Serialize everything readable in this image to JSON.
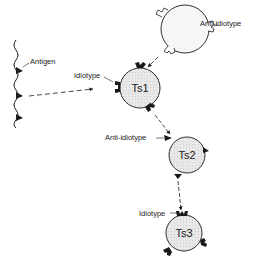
{
  "diagram": {
    "type": "idiotype network cascade",
    "nodes": [
      {
        "id": "antigen",
        "label": "Antigen",
        "shape": "wavy chain with triangular determinants"
      },
      {
        "id": "anti_idiotype_cell",
        "label": "",
        "annotation": "Anti-idiotype",
        "shape": "circle, light stipple, hollow receptors"
      },
      {
        "id": "ts1",
        "label": "Ts1",
        "annotation": "Idiotype",
        "shape": "circle, stippled, black receptors"
      },
      {
        "id": "ts2",
        "label": "Ts2",
        "annotation": "Anti-idiotype",
        "shape": "circle, stippled, black triangles"
      },
      {
        "id": "ts3",
        "label": "Ts3",
        "annotation": "Idiotype",
        "shape": "circle, stippled, black receptors"
      }
    ],
    "edges": [
      {
        "from": "antigen",
        "to": "ts1",
        "style": "dashed arrow"
      },
      {
        "from": "anti_idiotype_cell",
        "to": "ts1",
        "style": "dashed arrow"
      },
      {
        "from": "ts1",
        "to": "ts2",
        "style": "dashed arrow"
      },
      {
        "from": "ts2",
        "to": "ts3",
        "style": "dashed arrow"
      }
    ]
  },
  "labels": {
    "antigen": "Antigen",
    "anti_idiotype_top": "Anti-idiotype",
    "idiotype_ts1": "Idiotype",
    "ts1": "Ts1",
    "anti_idiotype_ts2": "Anti-idiotype",
    "ts2": "Ts2",
    "idiotype_ts3": "Idiotype",
    "ts3": "Ts3"
  },
  "colors": {
    "ink": "#1a1a1a",
    "cell_fill": "#e4e4e4",
    "top_cell_fill": "#f3f3f3"
  }
}
